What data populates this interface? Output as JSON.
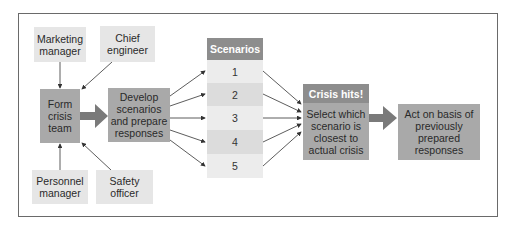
{
  "diagram": {
    "inputs": {
      "marketing_manager": "Marketing manager",
      "chief_engineer": "Chief engineer",
      "personnel_manager": "Personnel manager",
      "safety_officer": "Safety officer"
    },
    "steps": {
      "form_team": "Form crisis team",
      "develop": "Develop scenarios and prepare responses",
      "crisis_header": "Crisis hits!",
      "select": "Select which scenario is closest to actual crisis",
      "act": "Act on basis of previously prepared responses"
    },
    "scenarios": {
      "header": "Scenarios",
      "items": [
        "1",
        "2",
        "3",
        "4",
        "5"
      ]
    },
    "colors": {
      "light_box": "#e6e6e6",
      "mid_box": "#a9a9a9",
      "header": "#8d8d8d",
      "arrow": "#7a7a7a",
      "line": "#333333"
    }
  }
}
